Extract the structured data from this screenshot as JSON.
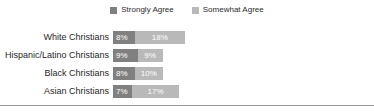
{
  "chart_data": {
    "type": "bar",
    "orientation": "horizontal",
    "stacked": true,
    "title": "",
    "subtitle": "",
    "xlabel": "",
    "ylabel": "",
    "grid": false,
    "legend_position": "top-center",
    "value_suffix": "%",
    "categories": [
      "White Christians",
      "Hispanic/Latino Christians",
      "Black Christians",
      "Asian Christians"
    ],
    "series": [
      {
        "name": "Strongly Agree",
        "color": "#808080",
        "values": [
          8,
          9,
          8,
          7
        ],
        "labels": [
          "8%",
          "9%",
          "8%",
          "7%"
        ]
      },
      {
        "name": "Somewhat Agree",
        "color": "#b9b9b9",
        "values": [
          18,
          9,
          10,
          17
        ],
        "labels": [
          "18%",
          "9%",
          "10%",
          "17%"
        ]
      }
    ],
    "totals": [
      26,
      18,
      18,
      24
    ],
    "xlim": [
      0,
      100
    ]
  },
  "legend": {
    "items": [
      {
        "label": "Strongly Agree",
        "color": "#808080"
      },
      {
        "label": "Somewhat Agree",
        "color": "#b9b9b9"
      }
    ]
  },
  "rows": [
    {
      "label": "White Christians",
      "strong_label": "8%",
      "somewhat_label": "18%",
      "strong_value": 8,
      "somewhat_value": 18
    },
    {
      "label": "Hispanic/Latino Christians",
      "strong_label": "9%",
      "somewhat_label": "9%",
      "strong_value": 9,
      "somewhat_value": 9
    },
    {
      "label": "Black Christians",
      "strong_label": "8%",
      "somewhat_label": "10%",
      "strong_value": 8,
      "somewhat_value": 10
    },
    {
      "label": "Asian Christians",
      "strong_label": "7%",
      "somewhat_label": "17%",
      "strong_value": 7,
      "somewhat_value": 17
    }
  ]
}
